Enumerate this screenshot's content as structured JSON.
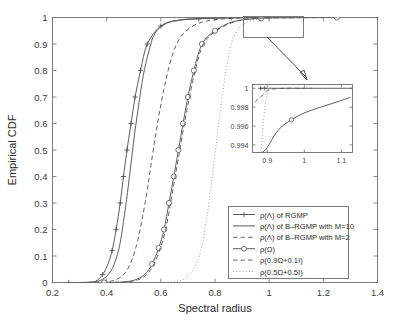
{
  "chart_data": {
    "type": "line",
    "title": "",
    "xlabel": "Spectral radius",
    "ylabel": "Empirical CDF",
    "xlim": [
      0.2,
      1.4
    ],
    "ylim": [
      0,
      1
    ],
    "xticks": [
      "0.2",
      "0.4",
      "0.6",
      "0.8",
      "1",
      "1.2",
      "1.4"
    ],
    "xtick_values": [
      0.2,
      0.4,
      0.6,
      0.8,
      1.0,
      1.2,
      1.4
    ],
    "yticks": [
      "0",
      "0.1",
      "0.2",
      "0.3",
      "0.4",
      "0.5",
      "0.6",
      "0.7",
      "0.8",
      "0.9",
      "1"
    ],
    "ytick_values": [
      0,
      0.1,
      0.2,
      0.3,
      0.4,
      0.5,
      0.6,
      0.7,
      0.8,
      0.9,
      1.0
    ],
    "grid": false,
    "legend_position": "lower right",
    "series": [
      {
        "name": "ρ(Λ) of RGMP",
        "style": "solid",
        "marker": "plus",
        "x": [
          0.26,
          0.33,
          0.36,
          0.385,
          0.405,
          0.42,
          0.435,
          0.45,
          0.462,
          0.475,
          0.49,
          0.505,
          0.525,
          0.55,
          0.6,
          0.66,
          0.74,
          0.86,
          1.0
        ],
        "y": [
          0.0,
          0.0,
          0.005,
          0.03,
          0.07,
          0.12,
          0.2,
          0.3,
          0.4,
          0.5,
          0.6,
          0.7,
          0.8,
          0.9,
          0.968,
          0.988,
          0.995,
          0.999,
          1.0
        ],
        "marker_x": [
          0.26,
          0.385,
          0.42,
          0.435,
          0.45,
          0.462,
          0.475,
          0.49,
          0.505,
          0.525,
          0.55,
          0.6,
          0.74,
          0.86
        ],
        "marker_y": [
          0.0,
          0.03,
          0.12,
          0.2,
          0.3,
          0.4,
          0.5,
          0.6,
          0.7,
          0.8,
          0.9,
          0.968,
          0.995,
          0.999
        ]
      },
      {
        "name": "ρ(Λ) of B–RGMP with M=10",
        "style": "solid",
        "marker": "none",
        "x": [
          0.3,
          0.355,
          0.385,
          0.41,
          0.43,
          0.448,
          0.462,
          0.477,
          0.49,
          0.503,
          0.518,
          0.535,
          0.555,
          0.578,
          0.62,
          0.67,
          0.74,
          0.85,
          1.0
        ],
        "y": [
          0.0,
          0.003,
          0.012,
          0.035,
          0.075,
          0.14,
          0.23,
          0.34,
          0.45,
          0.56,
          0.67,
          0.78,
          0.87,
          0.94,
          0.978,
          0.991,
          0.996,
          0.999,
          1.0
        ]
      },
      {
        "name": "ρ(Λ) of B–RGMP with M=2",
        "style": "dashed",
        "marker": "none",
        "x": [
          0.355,
          0.41,
          0.445,
          0.472,
          0.495,
          0.515,
          0.533,
          0.55,
          0.566,
          0.583,
          0.6,
          0.62,
          0.643,
          0.672,
          0.715,
          0.77,
          0.85,
          0.95,
          1.05
        ],
        "y": [
          0.0,
          0.004,
          0.016,
          0.042,
          0.09,
          0.16,
          0.25,
          0.35,
          0.46,
          0.57,
          0.67,
          0.77,
          0.86,
          0.925,
          0.966,
          0.987,
          0.996,
          0.999,
          1.0
        ]
      },
      {
        "name": "ρ(Ω)",
        "style": "solid",
        "marker": "circle",
        "x": [
          0.39,
          0.46,
          0.505,
          0.54,
          0.568,
          0.592,
          0.612,
          0.63,
          0.648,
          0.665,
          0.682,
          0.7,
          0.722,
          0.752,
          0.8,
          0.87,
          0.97,
          1.1,
          1.25
        ],
        "y": [
          0.0,
          0.002,
          0.01,
          0.03,
          0.07,
          0.13,
          0.2,
          0.3,
          0.4,
          0.5,
          0.6,
          0.7,
          0.8,
          0.9,
          0.95,
          0.985,
          0.997,
          0.999,
          1.0
        ],
        "marker_x": [
          0.39,
          0.568,
          0.592,
          0.612,
          0.63,
          0.648,
          0.665,
          0.682,
          0.7,
          0.722,
          0.752,
          0.8,
          0.97,
          1.25
        ],
        "marker_y": [
          0.0,
          0.07,
          0.13,
          0.2,
          0.3,
          0.4,
          0.5,
          0.6,
          0.7,
          0.8,
          0.9,
          0.95,
          0.997,
          1.0
        ]
      },
      {
        "name": "ρ(0.9Ω+0.1I)",
        "style": "dashed",
        "marker": "none",
        "x": [
          0.4,
          0.47,
          0.515,
          0.548,
          0.575,
          0.598,
          0.618,
          0.636,
          0.653,
          0.67,
          0.687,
          0.706,
          0.727,
          0.757,
          0.805,
          0.875,
          0.96,
          1.08,
          1.2
        ],
        "y": [
          0.0,
          0.002,
          0.01,
          0.03,
          0.07,
          0.13,
          0.2,
          0.3,
          0.4,
          0.5,
          0.6,
          0.7,
          0.8,
          0.9,
          0.95,
          0.985,
          0.997,
          0.999,
          1.0
        ]
      },
      {
        "name": "ρ(0.5Ω+0.5I)",
        "style": "dotted",
        "marker": "none",
        "x": [
          0.6,
          0.655,
          0.69,
          0.715,
          0.735,
          0.752,
          0.766,
          0.779,
          0.791,
          0.803,
          0.815,
          0.828,
          0.842,
          0.86,
          0.885,
          0.92,
          0.965,
          1.03,
          1.12
        ],
        "y": [
          0.0,
          0.004,
          0.015,
          0.04,
          0.08,
          0.14,
          0.22,
          0.31,
          0.41,
          0.51,
          0.61,
          0.71,
          0.81,
          0.9,
          0.955,
          0.983,
          0.995,
          0.999,
          1.0
        ]
      }
    ],
    "inset": {
      "xlim": [
        0.86,
        1.13
      ],
      "ylim": [
        0.9932,
        1.0004
      ],
      "xticks": [
        "0.9",
        "1",
        "1.1"
      ],
      "xtick_values": [
        0.9,
        1.0,
        1.1
      ],
      "yticks": [
        "1",
        "0.998",
        "0.996",
        "0.994"
      ],
      "ytick_values": [
        1.0,
        0.998,
        0.996,
        0.994
      ],
      "series": [
        {
          "name": "ρ(Λ) of RGMP",
          "style": "solid",
          "marker": "plus",
          "x": [
            0.876,
            0.9,
            0.95,
            1.0,
            1.05,
            1.1,
            1.13
          ],
          "y": [
            1.0,
            1.0,
            1.0,
            1.0,
            1.0,
            1.0,
            1.0
          ],
          "marker_x": [
            0.882,
            0.893
          ],
          "marker_y": [
            1.0,
            1.0
          ]
        },
        {
          "name": "ρ(Λ) of B–RGMP with M=2",
          "style": "dashed",
          "marker": "none",
          "x": [
            0.866,
            0.878,
            0.888,
            0.896,
            0.905,
            0.92,
            0.95,
            0.99,
            1.02
          ],
          "y": [
            0.9985,
            0.99895,
            0.9993,
            0.99962,
            0.99985,
            0.99995,
            1.0,
            1.0,
            1.0
          ]
        },
        {
          "name": "ρ(Ω)",
          "style": "solid",
          "marker": "circle",
          "x": [
            0.885,
            0.893,
            0.9,
            0.908,
            0.918,
            0.93,
            0.945,
            0.965,
            0.985,
            1.01,
            1.04,
            1.07,
            1.1,
            1.125
          ],
          "y": [
            0.99318,
            0.9934,
            0.99375,
            0.99425,
            0.99495,
            0.99558,
            0.99615,
            0.99665,
            0.99712,
            0.99755,
            0.99795,
            0.99832,
            0.99872,
            0.99905
          ],
          "marker_x": [
            0.965
          ],
          "marker_y": [
            0.99665
          ]
        },
        {
          "name": "ρ(0.5Ω+0.5I)",
          "style": "dotted",
          "marker": "none",
          "x": [
            0.884,
            0.888,
            0.892,
            0.896,
            0.899,
            0.903,
            0.908
          ],
          "y": [
            0.9933,
            0.9957,
            0.99755,
            0.99885,
            0.99945,
            0.99982,
            1.0
          ]
        }
      ],
      "zoom_region_label": "zoom-region-box"
    }
  },
  "legend": {
    "entries": [
      {
        "label": "ρ(Λ) of RGMP",
        "style": "solid",
        "marker": "plus"
      },
      {
        "label": "ρ(Λ) of B–RGMP with M=10",
        "style": "solid",
        "marker": "none"
      },
      {
        "label": "ρ(Λ) of B–RGMP with M=2",
        "style": "dashed",
        "marker": "none"
      },
      {
        "label": "ρ(Ω)",
        "style": "solid",
        "marker": "circle"
      },
      {
        "label": "ρ(0.9Ω+0.1I)",
        "style": "dashed",
        "marker": "none"
      },
      {
        "label": "ρ(0.5Ω+0.5I)",
        "style": "dotted",
        "marker": "none"
      }
    ]
  }
}
